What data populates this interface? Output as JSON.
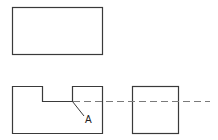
{
  "diagram": {
    "type": "orthographic-projection",
    "views": [
      {
        "name": "top-view",
        "shape": "rectangle",
        "x": 12,
        "y": 7,
        "width": 90,
        "height": 47
      },
      {
        "name": "front-view",
        "shape": "notched-rectangle",
        "x": 12,
        "y": 86,
        "width": 90,
        "height": 47,
        "notch": {
          "x1": 42,
          "x2": 72,
          "depth_to_y": 101
        }
      },
      {
        "name": "side-view",
        "shape": "rectangle",
        "x": 132,
        "y": 86,
        "width": 46,
        "height": 47
      }
    ],
    "projection_line": {
      "style": "dashed",
      "y": 101,
      "x_start": 73,
      "x_end": 210
    },
    "annotation": {
      "label": "A",
      "leader_from": [
        72,
        101
      ],
      "leader_to": [
        84,
        116
      ]
    },
    "colors": {
      "outline": "#3a3a3a",
      "dashed": "#7a7a7a",
      "background": "#ffffff"
    }
  }
}
